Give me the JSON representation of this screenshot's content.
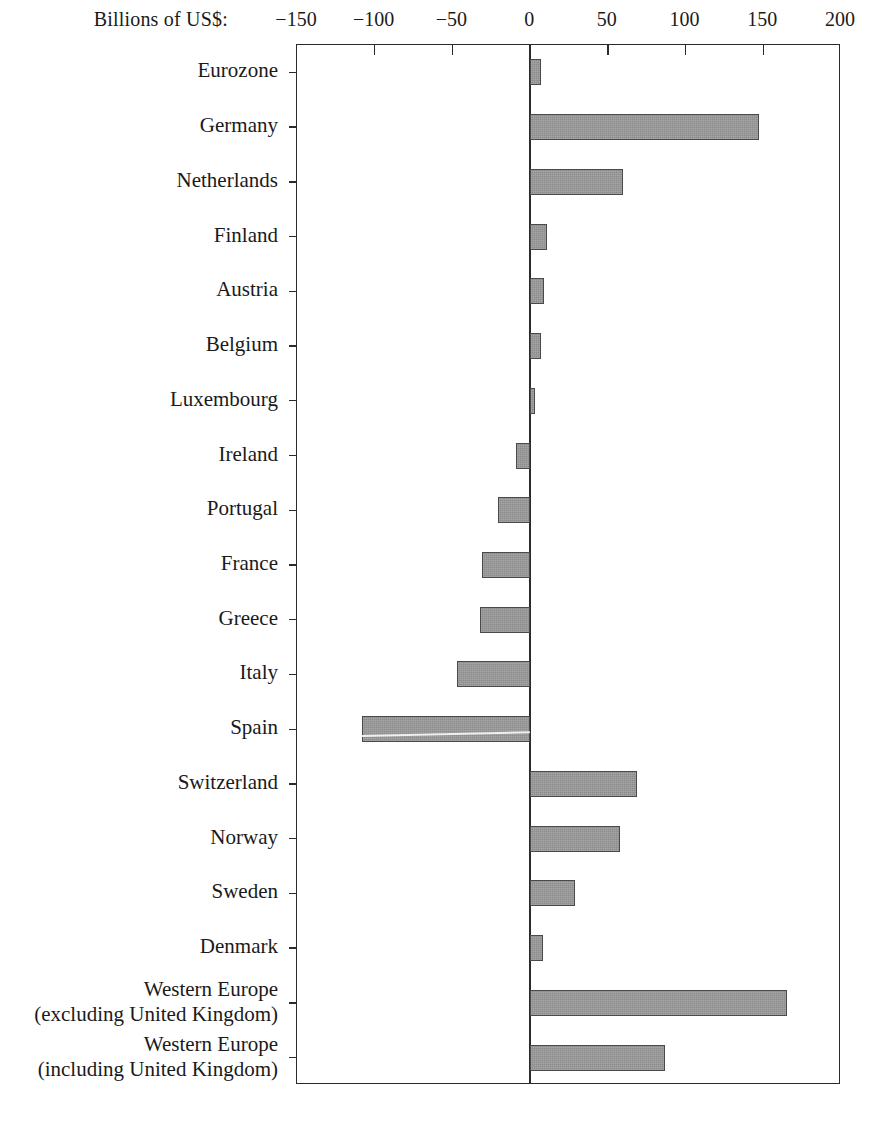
{
  "axis": {
    "unit_label": "Billions of US$:",
    "tick_labels": [
      "−150",
      "−100",
      "−50",
      "0",
      "50",
      "100",
      "150",
      "200"
    ],
    "tick_values": [
      -150,
      -100,
      -50,
      0,
      50,
      100,
      150,
      200
    ],
    "min": -150,
    "max": 200
  },
  "chart_data": {
    "type": "bar",
    "orientation": "horizontal",
    "title": "",
    "subtitle": "",
    "xlabel": "Billions of US$:",
    "ylabel": "",
    "xlim": [
      -150,
      200
    ],
    "xticks": [
      -150,
      -100,
      -50,
      0,
      50,
      100,
      150,
      200
    ],
    "xtick_labels": [
      "−150",
      "−100",
      "−50",
      "0",
      "50",
      "100",
      "150",
      "200"
    ],
    "grid": false,
    "legend": null,
    "bar_color": "#8c8c8c",
    "bar_edge_color": "#4a4a4a",
    "categories": [
      "Eurozone",
      "Germany",
      "Netherlands",
      "Finland",
      "Austria",
      "Belgium",
      "Luxembourg",
      "Ireland",
      "Portugal",
      "France",
      "Greece",
      "Italy",
      "Spain",
      "Switzerland",
      "Norway",
      "Sweden",
      "Denmark",
      "Western Europe\n(excluding United Kingdom)",
      "Western Europe\n(including United Kingdom)"
    ],
    "values": [
      7,
      147,
      60,
      11,
      9,
      7,
      3,
      -9,
      -21,
      -31,
      -32,
      -47,
      -108,
      69,
      58,
      29,
      8,
      165,
      87
    ]
  }
}
